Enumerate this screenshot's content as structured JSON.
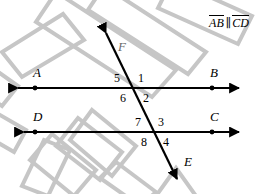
{
  "figure": {
    "type": "geometry-diagram",
    "given_statement": {
      "segment_1": "AB",
      "separator": "∥",
      "segment_2": "CD",
      "full_text": "AB ∥ CD"
    },
    "points": [
      {
        "name": "A",
        "label": "A",
        "x": 35,
        "y": 88,
        "label_x": 33,
        "label_y": 66
      },
      {
        "name": "B",
        "label": "B",
        "x": 212,
        "y": 88,
        "label_x": 210,
        "label_y": 66
      },
      {
        "name": "C",
        "label": "C",
        "x": 212,
        "y": 132,
        "label_x": 210,
        "label_y": 110
      },
      {
        "name": "D",
        "label": "D",
        "x": 35,
        "y": 132,
        "label_x": 33,
        "label_y": 110
      },
      {
        "name": "E",
        "label": "E",
        "x": 180,
        "y": 184,
        "label_x": 184,
        "label_y": 155
      },
      {
        "name": "F",
        "label": "F",
        "x": 103,
        "y": 27,
        "label_x": 118,
        "label_y": 40
      }
    ],
    "lines": [
      {
        "name": "line-ab",
        "label": "AB",
        "x1": 14,
        "y1": 88,
        "x2": 243,
        "y2": 88,
        "arrows": "both"
      },
      {
        "name": "line-cd",
        "label": "CD",
        "x1": 20,
        "y1": 132,
        "x2": 243,
        "y2": 132,
        "arrows": "both"
      },
      {
        "name": "transversal-fe",
        "label": "FE",
        "x1": 103,
        "y1": 27,
        "x2": 180,
        "y2": 184,
        "arrows": "both"
      }
    ],
    "intersections": [
      {
        "name": "upper-intersection",
        "x": 134,
        "y": 88
      },
      {
        "name": "lower-intersection",
        "x": 152,
        "y": 132
      }
    ],
    "angles": [
      {
        "id": "1",
        "label": "1",
        "position": "upper-right-of-upper-intersection",
        "x": 138,
        "y": 73
      },
      {
        "id": "2",
        "label": "2",
        "position": "lower-right-of-upper-intersection",
        "x": 143,
        "y": 93
      },
      {
        "id": "3",
        "label": "3",
        "position": "upper-right-of-lower-intersection",
        "x": 158,
        "y": 117
      },
      {
        "id": "4",
        "label": "4",
        "position": "lower-right-of-lower-intersection",
        "x": 163,
        "y": 137
      },
      {
        "id": "5",
        "label": "5",
        "position": "upper-left-of-upper-intersection",
        "x": 115,
        "y": 73
      },
      {
        "id": "6",
        "label": "6",
        "position": "lower-left-of-upper-intersection",
        "x": 121,
        "y": 93
      },
      {
        "id": "7",
        "label": "7",
        "position": "upper-left-of-lower-intersection",
        "x": 136,
        "y": 117
      },
      {
        "id": "8",
        "label": "8",
        "position": "lower-left-of-lower-intersection",
        "x": 141,
        "y": 137
      }
    ],
    "colors": {
      "line": "#000000",
      "text": "#000000",
      "watermark": "#c6c6c6",
      "background": "#ffffff",
      "faint_text": "#6a6a6a"
    }
  }
}
